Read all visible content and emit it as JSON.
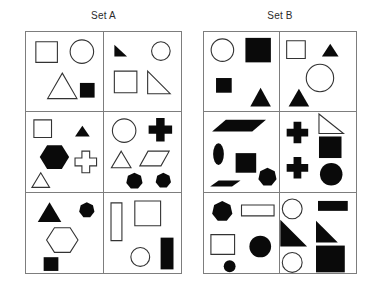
{
  "page": {
    "background_color": "#ffffff",
    "grid_line_color": "#7d7d7d",
    "shape_outline_color": "#333333",
    "shape_fill_color": "#0a0a0a"
  },
  "sets": [
    {
      "id": "set-a",
      "label": "Set A",
      "columns": 2,
      "rows": 3,
      "cells": [
        {
          "id": "a1",
          "position": "row1-col1",
          "shapes": [
            {
              "name": "square",
              "fill": "open",
              "size": "medium",
              "x": 10,
              "y": 10,
              "w": 22,
              "h": 21
            },
            {
              "name": "circle",
              "fill": "open",
              "size": "medium",
              "x": 45,
              "y": 8,
              "w": 24,
              "h": 24
            },
            {
              "name": "triangle",
              "fill": "open",
              "size": "large",
              "x": 22,
              "y": 42,
              "w": 30,
              "h": 26
            },
            {
              "name": "square",
              "fill": "filled",
              "size": "small",
              "x": 55,
              "y": 52,
              "w": 15,
              "h": 15
            }
          ]
        },
        {
          "id": "a2",
          "position": "row1-col2",
          "shapes": [
            {
              "name": "right-triangle",
              "fill": "filled",
              "size": "small",
              "x": 10,
              "y": 13,
              "w": 13,
              "h": 12
            },
            {
              "name": "circle",
              "fill": "open",
              "size": "small",
              "x": 48,
              "y": 10,
              "w": 19,
              "h": 19
            },
            {
              "name": "square",
              "fill": "open",
              "size": "medium",
              "x": 10,
              "y": 40,
              "w": 23,
              "h": 22
            },
            {
              "name": "right-triangle",
              "fill": "open",
              "size": "medium",
              "x": 44,
              "y": 40,
              "w": 23,
              "h": 23
            }
          ]
        },
        {
          "id": "a3",
          "position": "row2-col1",
          "shapes": [
            {
              "name": "square",
              "fill": "open",
              "size": "small",
              "x": 8,
              "y": 8,
              "w": 18,
              "h": 18
            },
            {
              "name": "triangle",
              "fill": "filled",
              "size": "small",
              "x": 50,
              "y": 14,
              "w": 15,
              "h": 11
            },
            {
              "name": "hexagon",
              "fill": "filled",
              "size": "large",
              "x": 14,
              "y": 32,
              "w": 30,
              "h": 28
            },
            {
              "name": "cross",
              "fill": "open",
              "size": "medium",
              "x": 50,
              "y": 40,
              "w": 22,
              "h": 22
            },
            {
              "name": "triangle",
              "fill": "open",
              "size": "small",
              "x": 6,
              "y": 62,
              "w": 18,
              "h": 15
            }
          ]
        },
        {
          "id": "a4",
          "position": "row2-col2",
          "shapes": [
            {
              "name": "circle",
              "fill": "open",
              "size": "medium",
              "x": 8,
              "y": 7,
              "w": 24,
              "h": 24
            },
            {
              "name": "cross",
              "fill": "filled",
              "size": "medium",
              "x": 45,
              "y": 6,
              "w": 24,
              "h": 24
            },
            {
              "name": "triangle",
              "fill": "open",
              "size": "small",
              "x": 7,
              "y": 40,
              "w": 20,
              "h": 17
            },
            {
              "name": "parallelogram",
              "fill": "open",
              "size": "medium",
              "x": 36,
              "y": 40,
              "w": 30,
              "h": 15
            },
            {
              "name": "heptagon",
              "fill": "filled",
              "size": "small",
              "x": 22,
              "y": 62,
              "w": 17,
              "h": 17
            },
            {
              "name": "heptagon",
              "fill": "filled",
              "size": "small",
              "x": 52,
              "y": 62,
              "w": 16,
              "h": 16
            }
          ]
        },
        {
          "id": "a5",
          "position": "row3-col1",
          "shapes": [
            {
              "name": "triangle",
              "fill": "filled",
              "size": "medium",
              "x": 12,
              "y": 9,
              "w": 24,
              "h": 20
            },
            {
              "name": "heptagon",
              "fill": "filled",
              "size": "small",
              "x": 54,
              "y": 9,
              "w": 16,
              "h": 16
            },
            {
              "name": "hexagon",
              "fill": "open",
              "size": "large",
              "x": 21,
              "y": 33,
              "w": 32,
              "h": 29
            },
            {
              "name": "square",
              "fill": "filled",
              "size": "small",
              "x": 18,
              "y": 65,
              "w": 15,
              "h": 14
            }
          ]
        },
        {
          "id": "a6",
          "position": "row3-col2",
          "shapes": [
            {
              "name": "rectangle-vertical",
              "fill": "open",
              "size": "tall",
              "x": 7,
              "y": 10,
              "w": 11,
              "h": 38
            },
            {
              "name": "square",
              "fill": "open",
              "size": "large",
              "x": 31,
              "y": 8,
              "w": 26,
              "h": 25
            },
            {
              "name": "circle",
              "fill": "open",
              "size": "small",
              "x": 27,
              "y": 55,
              "w": 19,
              "h": 19
            },
            {
              "name": "rectangle-vertical",
              "fill": "filled",
              "size": "tall",
              "x": 57,
              "y": 45,
              "w": 13,
              "h": 32
            }
          ]
        }
      ]
    },
    {
      "id": "set-b",
      "label": "Set B",
      "columns": 2,
      "rows": 3,
      "cells": [
        {
          "id": "b1",
          "position": "row1-col1",
          "shapes": [
            {
              "name": "circle",
              "fill": "open",
              "size": "medium",
              "x": 7,
              "y": 7,
              "w": 23,
              "h": 23
            },
            {
              "name": "square",
              "fill": "filled",
              "size": "large",
              "x": 42,
              "y": 6,
              "w": 26,
              "h": 25
            },
            {
              "name": "square",
              "fill": "filled",
              "size": "small",
              "x": 12,
              "y": 47,
              "w": 16,
              "h": 15
            },
            {
              "name": "triangle",
              "fill": "filled",
              "size": "medium",
              "x": 47,
              "y": 57,
              "w": 21,
              "h": 19
            }
          ]
        },
        {
          "id": "b2",
          "position": "row1-col2",
          "shapes": [
            {
              "name": "square",
              "fill": "open",
              "size": "small",
              "x": 6,
              "y": 9,
              "w": 19,
              "h": 18
            },
            {
              "name": "triangle",
              "fill": "filled",
              "size": "small",
              "x": 42,
              "y": 12,
              "w": 17,
              "h": 13
            },
            {
              "name": "circle",
              "fill": "open",
              "size": "large",
              "x": 26,
              "y": 33,
              "w": 28,
              "h": 28
            },
            {
              "name": "triangle",
              "fill": "filled",
              "size": "medium",
              "x": 8,
              "y": 58,
              "w": 21,
              "h": 18
            }
          ]
        },
        {
          "id": "b3",
          "position": "row2-col1",
          "shapes": [
            {
              "name": "parallelogram",
              "fill": "filled",
              "size": "wide",
              "x": 8,
              "y": 8,
              "w": 55,
              "h": 12
            },
            {
              "name": "ellipse-vertical",
              "fill": "filled",
              "size": "small",
              "x": 9,
              "y": 32,
              "w": 11,
              "h": 22
            },
            {
              "name": "square",
              "fill": "filled",
              "size": "medium",
              "x": 32,
              "y": 42,
              "w": 21,
              "h": 20
            },
            {
              "name": "heptagon",
              "fill": "filled",
              "size": "medium",
              "x": 55,
              "y": 57,
              "w": 19,
              "h": 19
            },
            {
              "name": "parallelogram-thin",
              "fill": "filled",
              "size": "thin",
              "x": 6,
              "y": 70,
              "w": 31,
              "h": 6
            }
          ]
        },
        {
          "id": "b4",
          "position": "row2-col2",
          "shapes": [
            {
              "name": "cross",
              "fill": "filled",
              "size": "medium",
              "x": 6,
              "y": 10,
              "w": 22,
              "h": 22
            },
            {
              "name": "right-triangle",
              "fill": "open",
              "size": "small",
              "x": 39,
              "y": 2,
              "w": 25,
              "h": 20
            },
            {
              "name": "square",
              "fill": "filled",
              "size": "medium",
              "x": 39,
              "y": 25,
              "w": 23,
              "h": 22
            },
            {
              "name": "cross",
              "fill": "filled",
              "size": "medium",
              "x": 6,
              "y": 46,
              "w": 22,
              "h": 22
            },
            {
              "name": "circle",
              "fill": "filled",
              "size": "medium",
              "x": 40,
              "y": 52,
              "w": 23,
              "h": 23
            }
          ]
        },
        {
          "id": "b5",
          "position": "row3-col1",
          "shapes": [
            {
              "name": "heptagon",
              "fill": "filled",
              "size": "medium",
              "x": 8,
              "y": 8,
              "w": 21,
              "h": 21
            },
            {
              "name": "rectangle-horizontal",
              "fill": "open",
              "size": "wide",
              "x": 38,
              "y": 12,
              "w": 33,
              "h": 11
            },
            {
              "name": "square",
              "fill": "open",
              "size": "medium",
              "x": 7,
              "y": 42,
              "w": 24,
              "h": 20
            },
            {
              "name": "circle",
              "fill": "filled",
              "size": "medium",
              "x": 46,
              "y": 43,
              "w": 22,
              "h": 22
            },
            {
              "name": "circle",
              "fill": "filled",
              "size": "small",
              "x": 20,
              "y": 68,
              "w": 12,
              "h": 12
            }
          ]
        },
        {
          "id": "b6",
          "position": "row3-col2",
          "shapes": [
            {
              "name": "circle",
              "fill": "open",
              "size": "medium",
              "x": 2,
              "y": 6,
              "w": 20,
              "h": 20
            },
            {
              "name": "rectangle-horizontal",
              "fill": "filled",
              "size": "wide",
              "x": 38,
              "y": 8,
              "w": 30,
              "h": 10
            },
            {
              "name": "triangle-right-large",
              "fill": "filled",
              "size": "large",
              "x": 0,
              "y": 27,
              "w": 27,
              "h": 27
            },
            {
              "name": "right-triangle",
              "fill": "filled",
              "size": "medium",
              "x": 36,
              "y": 28,
              "w": 22,
              "h": 22
            },
            {
              "name": "circle",
              "fill": "open",
              "size": "medium",
              "x": 2,
              "y": 60,
              "w": 20,
              "h": 20
            },
            {
              "name": "square",
              "fill": "filled",
              "size": "large",
              "x": 36,
              "y": 53,
              "w": 29,
              "h": 27
            }
          ]
        }
      ]
    }
  ]
}
